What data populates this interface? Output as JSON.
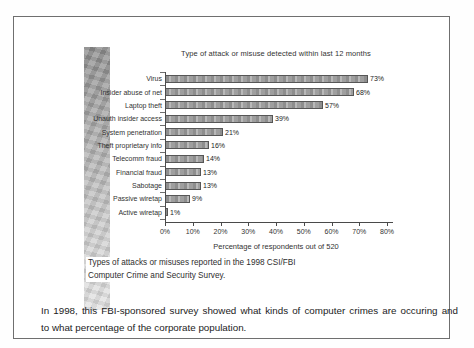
{
  "page": {
    "background_color": "#ffffff",
    "frame_border_color": "#6f6f6f",
    "gradient_strip_colors": [
      "#8e8e8e",
      "#e3e3e3"
    ]
  },
  "chart_data": {
    "type": "bar",
    "orientation": "horizontal",
    "title": "Type of attack or misuse detected within last 12 months",
    "categories": [
      "Virus",
      "Insider abuse of net",
      "Laptop theft",
      "Unauth insider access",
      "System penetration",
      "Theft proprietary info",
      "Telecomm fraud",
      "Financial fraud",
      "Sabotage",
      "Passive wiretap",
      "Active wiretap"
    ],
    "values": [
      73,
      68,
      57,
      39,
      21,
      16,
      14,
      13,
      13,
      9,
      1
    ],
    "value_labels": [
      "73%",
      "68%",
      "57%",
      "39%",
      "21%",
      "16%",
      "14%",
      "13%",
      "13%",
      "9%",
      "1%"
    ],
    "xlabel": "Percentage of respondents out of 520",
    "ylabel": "",
    "xlim": [
      0,
      80
    ],
    "x_ticks": [
      "0%",
      "10%",
      "20%",
      "30%",
      "40%",
      "50%",
      "60%",
      "70%",
      "80%"
    ],
    "grid": false,
    "legend": "none",
    "bar_color": "#a8a8a8",
    "bar_border_color": "#565656"
  },
  "figure": {
    "caption_lines": [
      "Types of attacks or misuses reported in the 1998 CSI/FBI",
      "Computer Crime and Security Survey."
    ],
    "body_lines": [
      "In 1998, this FBI-sponsored survey showed what kinds of computer crimes are occuring and",
      "to what percentage of the corporate population."
    ]
  }
}
